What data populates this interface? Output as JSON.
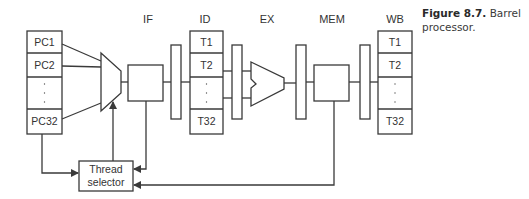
{
  "figure": {
    "caption_label": "Figure 8.7.",
    "caption_line1": "Barrel",
    "caption_line2": "processor."
  },
  "stages": {
    "if": "IF",
    "id": "ID",
    "ex": "EX",
    "mem": "MEM",
    "wb": "WB"
  },
  "pc_file": {
    "rows": [
      "PC1",
      "PC2",
      "·",
      "PC32"
    ]
  },
  "id_regfile": {
    "rows": [
      "T1",
      "T2",
      "·",
      "T32"
    ]
  },
  "wb_regfile": {
    "rows": [
      "T1",
      "T2",
      "·",
      "T32"
    ]
  },
  "thread_selector": {
    "line1": "Thread",
    "line2": "selector"
  },
  "colors": {
    "stroke": "#3a3a3a",
    "text": "#333333",
    "background": "#ffffff"
  }
}
